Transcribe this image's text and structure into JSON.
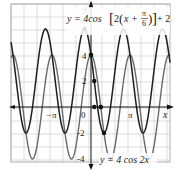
{
  "chart_data": {
    "type": "line",
    "title": "",
    "xlabel": "x",
    "ylabel": "y",
    "x_tick_labels": [
      "-π",
      "0",
      "π"
    ],
    "y_tick_labels": [
      "4",
      "2",
      "-2",
      "-4"
    ],
    "xlim": [
      -6.4,
      6.4
    ],
    "ylim": [
      -4.5,
      7.5
    ],
    "grid": true,
    "series": [
      {
        "name": "y = 4 cos 2x",
        "function": "4*cos(2*x)",
        "color": "#6a6a6a",
        "label": "y = 4 cos 2x",
        "marked_points": [
          [
            0,
            4
          ],
          [
            0.785,
            0
          ],
          [
            1.571,
            -4
          ]
        ]
      },
      {
        "name": "y = 4cos[2(x + π/6)] + 2",
        "function": "4*cos(2*(x+pi/6))+2",
        "color": "#222222",
        "label": "y = 4cos[2(x + π/6)] + 2",
        "marked_points": [
          [
            -0.524,
            6
          ],
          [
            0,
            4
          ],
          [
            0.262,
            2
          ],
          [
            1.047,
            -2
          ]
        ]
      }
    ],
    "axis_points": [
      [
        0.262,
        0
      ],
      [
        0.785,
        0
      ]
    ]
  },
  "labels": {
    "x_axis": "x",
    "y_axis": "y",
    "tick_neg_pi": "−π",
    "tick_zero": "0",
    "tick_pi": "π",
    "tick_4": "4",
    "tick_2": "2",
    "tick_neg2": "-2",
    "tick_neg4": "-4",
    "eq_top_prefix": "y = 4cos",
    "eq_top_inner": "2",
    "eq_top_x": "x +",
    "eq_top_pi": "π",
    "eq_top_6": "6",
    "eq_top_suffix": "+ 2",
    "eq_bottom": "y = 4 cos 2x"
  }
}
